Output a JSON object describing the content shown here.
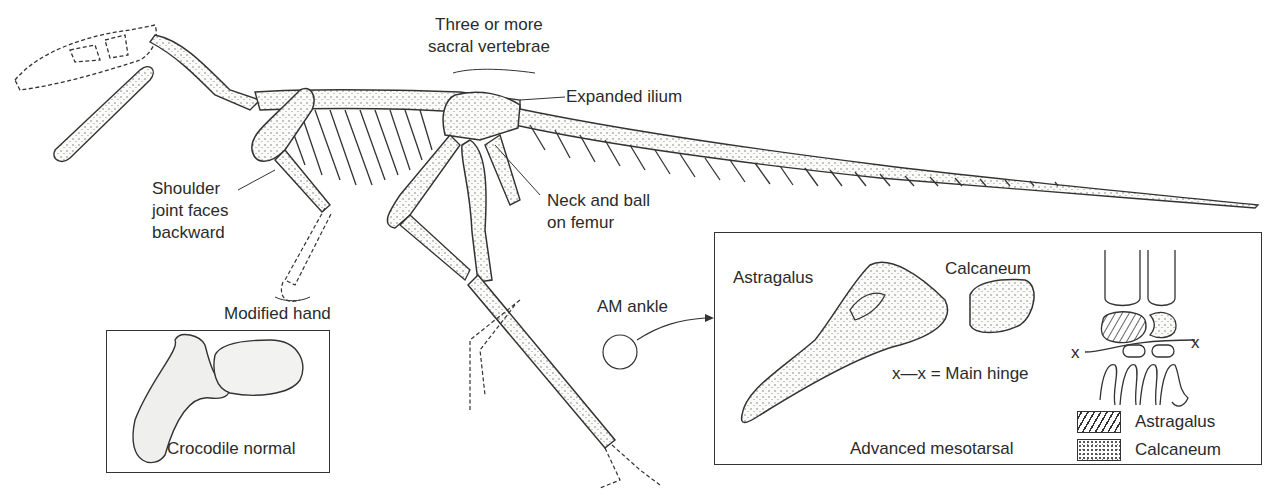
{
  "figure": {
    "labels": {
      "sacral": [
        "Three or more",
        "sacral vertebrae"
      ],
      "ilium": "Expanded ilium",
      "shoulder": [
        "Shoulder",
        "joint faces",
        "backward"
      ],
      "femur": [
        "Neck and ball",
        "on femur"
      ],
      "hand": "Modified hand",
      "ankle": "AM ankle"
    },
    "inset_crocodile": {
      "caption": "Crocodile normal"
    },
    "inset_mesotarsal": {
      "title": "Advanced mesotarsal",
      "astragalus_label": "Astragalus",
      "calcaneum_label": "Calcaneum",
      "hinge_label": "x—x = Main hinge",
      "hinge_marker_left": "x",
      "hinge_marker_right": "x",
      "legend": [
        {
          "pattern": "hatched",
          "label": "Astragalus"
        },
        {
          "pattern": "stippled",
          "label": "Calcaneum"
        }
      ]
    },
    "colors": {
      "line": "#2b2b2b",
      "background": "#ffffff",
      "bone_fill": "#f4f4f2",
      "stipple": "#555555"
    }
  }
}
